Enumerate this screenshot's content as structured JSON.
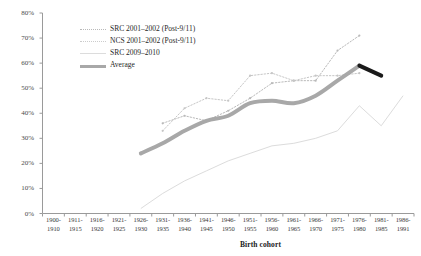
{
  "chart_data": {
    "type": "line",
    "title": "",
    "xlabel": "Birth cohort",
    "ylabel": "",
    "ylim": [
      0,
      80
    ],
    "yticks": [
      "0%",
      "10%",
      "20%",
      "30%",
      "40%",
      "50%",
      "60%",
      "70%",
      "80%"
    ],
    "grid": false,
    "legend_position": "upper-left-inside",
    "categories": [
      "1900-1910",
      "1911-1915",
      "1916-1920",
      "1921-1925",
      "1926-1930",
      "1931-1935",
      "1936-1940",
      "1941-1945",
      "1946-1950",
      "1951-1955",
      "1956-1960",
      "1961-1965",
      "1966-1970",
      "1971-1975",
      "1976-1980",
      "1981-1985",
      "1986-1991"
    ],
    "series": [
      {
        "name": "SRC 2001-2002 (Post-9/11)",
        "style": "dotted",
        "color": "#b9b9b9",
        "x": [
          "1931-1935",
          "1936-1940",
          "1941-1945",
          "1946-1950",
          "1951-1955",
          "1956-1960",
          "1961-1965",
          "1966-1970",
          "1971-1975",
          "1976-1980"
        ],
        "values": [
          36,
          39,
          37,
          41,
          46,
          52,
          53,
          53,
          65,
          71
        ]
      },
      {
        "name": "NCS 2001-2002 (Post-9/11)",
        "style": "dotted",
        "color": "#c6c6c6",
        "x": [
          "1931-1935",
          "1936-1940",
          "1941-1945",
          "1946-1950",
          "1951-1955",
          "1956-1960",
          "1961-1965",
          "1966-1970",
          "1971-1975",
          "1976-1980"
        ],
        "values": [
          33,
          42,
          46,
          45,
          55,
          56,
          53,
          55,
          55,
          56
        ]
      },
      {
        "name": "SRC 2009-2010",
        "style": "solid-thin",
        "color": "#dcdcdc",
        "x": [
          "1926-1930",
          "1931-1935",
          "1936-1940",
          "1941-1945",
          "1946-1950",
          "1951-1955",
          "1956-1960",
          "1961-1965",
          "1966-1970",
          "1971-1975",
          "1976-1980",
          "1981-1985",
          "1986-1991"
        ],
        "values": [
          2,
          8,
          13,
          17,
          21,
          24,
          27,
          28,
          30,
          33,
          43,
          35,
          47
        ]
      },
      {
        "name": "Average",
        "style": "solid-thick",
        "color": "#a8a8a8",
        "highlight_color": "#1a1a1a",
        "x": [
          "1926-1930",
          "1931-1935",
          "1936-1940",
          "1941-1945",
          "1946-1950",
          "1951-1955",
          "1956-1960",
          "1961-1965",
          "1966-1970",
          "1971-1975",
          "1976-1980",
          "1981-1985"
        ],
        "values": [
          24,
          28,
          33,
          37,
          39,
          44,
          45,
          44,
          47,
          53,
          59,
          55
        ],
        "highlight_from": "1976-1980"
      }
    ]
  },
  "legend": {
    "items": [
      {
        "label": "SRC 2001–2002 (Post-9/11)",
        "key": "dotted-a"
      },
      {
        "label": "NCS 2001–2002 (Post-9/11)",
        "key": "dotted-b"
      },
      {
        "label": "SRC 2009–2010",
        "key": "thin"
      },
      {
        "label": "Average",
        "key": "thick"
      }
    ]
  },
  "axes": {
    "x_title": "Birth cohort",
    "y_ticks": [
      "80%",
      "70%",
      "60%",
      "50%",
      "40%",
      "30%",
      "20%",
      "10%",
      "0%"
    ],
    "x_ticks": [
      {
        "top": "1900-",
        "bottom": "1910"
      },
      {
        "top": "1911-",
        "bottom": "1915"
      },
      {
        "top": "1916-",
        "bottom": "1920"
      },
      {
        "top": "1921-",
        "bottom": "1925"
      },
      {
        "top": "1926-",
        "bottom": "1930"
      },
      {
        "top": "1931-",
        "bottom": "1935"
      },
      {
        "top": "1936-",
        "bottom": "1940"
      },
      {
        "top": "1941-",
        "bottom": "1945"
      },
      {
        "top": "1946-",
        "bottom": "1950"
      },
      {
        "top": "1951-",
        "bottom": "1955"
      },
      {
        "top": "1956-",
        "bottom": "1960"
      },
      {
        "top": "1961-",
        "bottom": "1965"
      },
      {
        "top": "1966-",
        "bottom": "1970"
      },
      {
        "top": "1971-",
        "bottom": "1975"
      },
      {
        "top": "1976-",
        "bottom": "1980"
      },
      {
        "top": "1981-",
        "bottom": "1985"
      },
      {
        "top": "1986-",
        "bottom": "1991"
      }
    ]
  },
  "colors": {
    "axis": "#9a9a9a",
    "tick_text": "#4a4a4a",
    "average": "#a8a8a8",
    "average_highlight": "#1a1a1a",
    "src_2001": "#b9b9b9",
    "ncs_2001": "#c6c6c6",
    "src_2009": "#dcdcdc",
    "background": "#ffffff"
  }
}
